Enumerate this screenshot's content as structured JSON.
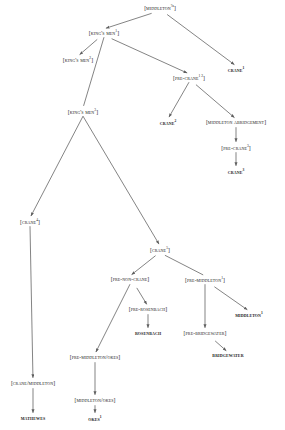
{
  "diagram": {
    "kind": "stemma / tree diagram",
    "width": 285,
    "height": 430,
    "background": "#ffffff",
    "ink": "#1a1a1a",
    "edge_color": "#6e6e6e",
    "legend_note": "Square brackets denote hypothetical (lost) states; bold small-caps denote extant witnesses.",
    "nodes": [
      {
        "id": "middleton_a",
        "label": "[Middleton ?a]",
        "open": "[",
        "name": "Middleton",
        "sup": "?a",
        "close": "]",
        "type": "hypothetical",
        "x": 160,
        "y": 8
      },
      {
        "id": "kings_men_1",
        "label": "[King's Men 1]",
        "open": "[",
        "name": "King's Men",
        "sup": "1",
        "close": "]",
        "type": "hypothetical",
        "x": 104,
        "y": 33
      },
      {
        "id": "kings_men_2",
        "label": "[King's Men 2]",
        "open": "[",
        "name": "King's Men",
        "sup": "2",
        "close": "]",
        "type": "hypothetical",
        "x": 78,
        "y": 60
      },
      {
        "id": "crane_1",
        "label": "Crane 1",
        "open": "",
        "name": "Crane",
        "sup": "1",
        "close": "",
        "type": "witness",
        "x": 236,
        "y": 70
      },
      {
        "id": "pre_crane_12",
        "label": "[Pre-Crane 1 2]",
        "open": "[",
        "name": "Pre-Crane",
        "sup": "1 2",
        "close": "]",
        "type": "hypothetical",
        "x": 189,
        "y": 78
      },
      {
        "id": "kings_men_3",
        "label": "[King's Men 3]",
        "open": "[",
        "name": "King's Men",
        "sup": "3",
        "close": "]",
        "type": "hypothetical",
        "x": 83,
        "y": 112
      },
      {
        "id": "crane_2",
        "label": "Crane 2",
        "open": "",
        "name": "Crane",
        "sup": "2",
        "close": "",
        "type": "witness",
        "x": 168,
        "y": 123
      },
      {
        "id": "middleton_abr",
        "label": "[Middleton abridgement]",
        "open": "[",
        "name": "Middleton abridgement",
        "sup": "",
        "close": "]",
        "type": "hypothetical",
        "x": 236,
        "y": 123
      },
      {
        "id": "pre_crane_3",
        "label": "[Pre-Crane 3]",
        "open": "[",
        "name": "Pre-Crane",
        "sup": "3",
        "close": "]",
        "type": "hypothetical",
        "x": 236,
        "y": 148
      },
      {
        "id": "crane_3",
        "label": "Crane 3",
        "open": "",
        "name": "Crane",
        "sup": "3",
        "close": "",
        "type": "witness",
        "x": 236,
        "y": 172
      },
      {
        "id": "crane_4",
        "label": "[Crane 4]",
        "open": "[",
        "name": "Crane",
        "sup": "4",
        "close": "]",
        "type": "hypothetical",
        "x": 30,
        "y": 222
      },
      {
        "id": "crane_5",
        "label": "[Crane 5]",
        "open": "[",
        "name": "Crane",
        "sup": "5",
        "close": "]",
        "type": "hypothetical",
        "x": 160,
        "y": 250
      },
      {
        "id": "pre_non_crane",
        "label": "[Pre-Non-Crane]",
        "open": "[",
        "name": "Pre-Non-Crane",
        "sup": "",
        "close": "]",
        "type": "hypothetical",
        "x": 130,
        "y": 280
      },
      {
        "id": "pre_middleton_1",
        "label": "[Pre-Middleton 1]",
        "open": "[",
        "name": "Pre-Middleton",
        "sup": "1",
        "close": "]",
        "type": "hypothetical",
        "x": 205,
        "y": 280
      },
      {
        "id": "pre_rosenbach",
        "label": "[Pre-Rosenbach]",
        "open": "[",
        "name": "Pre-Rosenbach",
        "sup": "",
        "close": "]",
        "type": "hypothetical",
        "x": 148,
        "y": 310
      },
      {
        "id": "middleton_1",
        "label": "Middleton 1",
        "open": "",
        "name": "Middleton",
        "sup": "1",
        "close": "",
        "type": "witness",
        "x": 249,
        "y": 315
      },
      {
        "id": "rosenbach",
        "label": "Rosenbach",
        "open": "",
        "name": "Rosenbach",
        "sup": "",
        "close": "",
        "type": "witness",
        "x": 148,
        "y": 334
      },
      {
        "id": "pre_bridgewater",
        "label": "[Pre-Bridgewater]",
        "open": "[",
        "name": "Pre-Bridgewater",
        "sup": "",
        "close": "]",
        "type": "hypothetical",
        "x": 205,
        "y": 334
      },
      {
        "id": "bridgewater",
        "label": "Bridgewater",
        "open": "",
        "name": "Bridgewater",
        "sup": "",
        "close": "",
        "type": "witness",
        "x": 228,
        "y": 356
      },
      {
        "id": "pre_middleton_okes",
        "label": "[Pre-Middleton/Okes]",
        "open": "[",
        "name": "Pre-Middleton/Okes",
        "sup": "",
        "close": "]",
        "type": "hypothetical",
        "x": 95,
        "y": 358
      },
      {
        "id": "crane_middleton",
        "label": "[Crane/Middleton]",
        "open": "[",
        "name": "Crane/Middleton",
        "sup": "",
        "close": "]",
        "type": "hypothetical",
        "x": 33,
        "y": 384
      },
      {
        "id": "middleton_okes",
        "label": "[Middleton/Okes]",
        "open": "[",
        "name": "Middleton/Okes",
        "sup": "",
        "close": "]",
        "type": "hypothetical",
        "x": 95,
        "y": 401
      },
      {
        "id": "mathewes",
        "label": "Mathewes",
        "open": "",
        "name": "Mathewes",
        "sup": "",
        "close": "",
        "type": "witness",
        "x": 33,
        "y": 419
      },
      {
        "id": "okes_1",
        "label": "Okes 1",
        "open": "",
        "name": "Okes",
        "sup": "1",
        "close": "",
        "type": "witness",
        "x": 95,
        "y": 419
      }
    ],
    "edges": [
      {
        "from": "middleton_a",
        "to": "kings_men_1",
        "style": "arrow"
      },
      {
        "from": "middleton_a",
        "to": "crane_1",
        "style": "arrow"
      },
      {
        "from": "kings_men_1",
        "to": "kings_men_2",
        "style": "arrow"
      },
      {
        "from": "kings_men_1",
        "to": "kings_men_3",
        "style": "plain"
      },
      {
        "from": "kings_men_1",
        "to": "pre_crane_12",
        "style": "arrow"
      },
      {
        "from": "pre_crane_12",
        "to": "crane_2",
        "style": "arrow"
      },
      {
        "from": "pre_crane_12",
        "to": "middleton_abr",
        "style": "arrow"
      },
      {
        "from": "middleton_abr",
        "to": "pre_crane_3",
        "style": "arrow"
      },
      {
        "from": "pre_crane_3",
        "to": "crane_3",
        "style": "arrow"
      },
      {
        "from": "kings_men_3",
        "to": "crane_4",
        "style": "arrow"
      },
      {
        "from": "kings_men_3",
        "to": "crane_5",
        "style": "arrow"
      },
      {
        "from": "crane_5",
        "to": "pre_non_crane",
        "style": "arrow"
      },
      {
        "from": "crane_5",
        "to": "pre_middleton_1",
        "style": "plain"
      },
      {
        "from": "pre_non_crane",
        "to": "pre_middleton_okes",
        "style": "arrow"
      },
      {
        "from": "pre_non_crane",
        "to": "pre_rosenbach",
        "style": "arrow"
      },
      {
        "from": "pre_rosenbach",
        "to": "rosenbach",
        "style": "arrow"
      },
      {
        "from": "pre_middleton_1",
        "to": "pre_bridgewater",
        "style": "arrow"
      },
      {
        "from": "pre_middleton_1",
        "to": "middleton_1",
        "style": "arrow"
      },
      {
        "from": "pre_bridgewater",
        "to": "bridgewater",
        "style": "arrow"
      },
      {
        "from": "crane_4",
        "to": "crane_middleton",
        "style": "arrow"
      },
      {
        "from": "crane_middleton",
        "to": "mathewes",
        "style": "arrow"
      },
      {
        "from": "pre_middleton_okes",
        "to": "middleton_okes",
        "style": "arrow"
      },
      {
        "from": "middleton_okes",
        "to": "okes_1",
        "style": "arrow"
      }
    ]
  }
}
